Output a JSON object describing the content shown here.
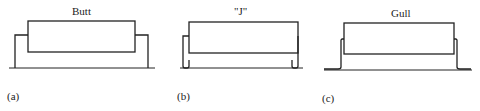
{
  "diagram": {
    "panels": [
      {
        "id": "a",
        "title": "Butt",
        "label": "(a)",
        "lead_style": "butt"
      },
      {
        "id": "b",
        "title": "\"J\"",
        "label": "(b)",
        "lead_style": "j-lead"
      },
      {
        "id": "c",
        "title": "Gull",
        "label": "(c)",
        "lead_style": "gull-wing"
      }
    ],
    "colors": {
      "stroke": "#222222",
      "background": "#ffffff"
    }
  }
}
